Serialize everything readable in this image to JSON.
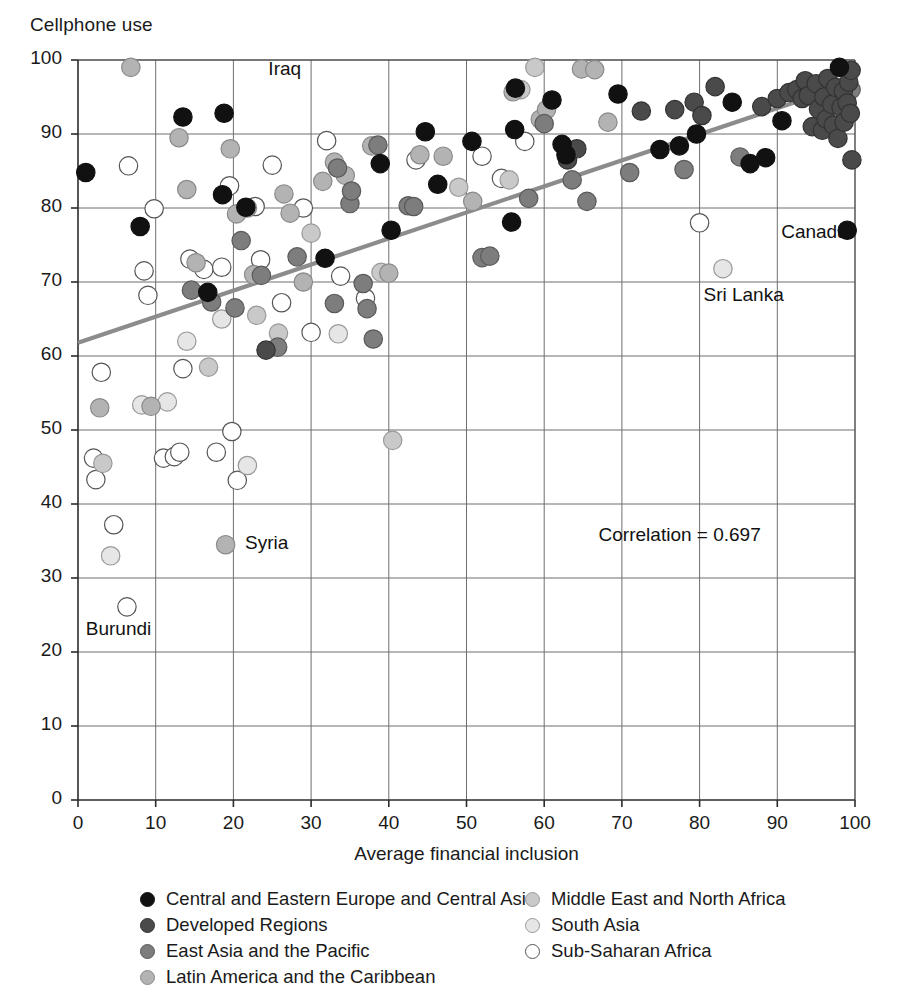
{
  "chart_data": {
    "type": "scatter",
    "title": "",
    "ylabel": "Cellphone use",
    "xlabel": "Average financial inclusion",
    "xlim": [
      0,
      100
    ],
    "ylim": [
      0,
      100
    ],
    "xticks": [
      0,
      10,
      20,
      30,
      40,
      50,
      60,
      70,
      80,
      90,
      100
    ],
    "yticks": [
      0,
      10,
      20,
      30,
      40,
      50,
      60,
      70,
      80,
      90,
      100
    ],
    "grid": true,
    "grid_step_x": 10,
    "grid_step_y": 10,
    "legend_position": "bottom",
    "trendline": {
      "x": [
        0,
        100
      ],
      "y": [
        61.8,
        97.0
      ],
      "color": "#8c8c8c"
    },
    "annotations": [
      {
        "text": "Iraq",
        "x": 24.5,
        "y": 98.5
      },
      {
        "text": "Canada",
        "x": 90.5,
        "y": 76.5
      },
      {
        "text": "Sri Lanka",
        "x": 80.5,
        "y": 68.0
      },
      {
        "text": "Syria",
        "x": 21.5,
        "y": 34.5
      },
      {
        "text": "Burundi",
        "x": 1.0,
        "y": 22.8
      },
      {
        "text": "Correlation = 0.697",
        "x": 67.0,
        "y": 35.5
      }
    ],
    "series": [
      {
        "name": "Central and Eastern Europe and Central Asia",
        "color": "#111111",
        "edge": "#111111",
        "points": [
          [
            1.0,
            84.8
          ],
          [
            8.0,
            77.5
          ],
          [
            13.5,
            92.3
          ],
          [
            18.8,
            92.8
          ],
          [
            18.6,
            81.8
          ],
          [
            16.7,
            68.6
          ],
          [
            21.6,
            80.1
          ],
          [
            31.8,
            73.2
          ],
          [
            38.9,
            86.0
          ],
          [
            40.3,
            77.0
          ],
          [
            44.7,
            90.3
          ],
          [
            46.3,
            83.2
          ],
          [
            50.7,
            89.0
          ],
          [
            55.8,
            78.1
          ],
          [
            56.2,
            90.6
          ],
          [
            56.3,
            96.2
          ],
          [
            61.0,
            94.6
          ],
          [
            62.3,
            88.6
          ],
          [
            62.8,
            87.2
          ],
          [
            69.5,
            95.4
          ],
          [
            74.9,
            87.9
          ],
          [
            77.4,
            88.4
          ],
          [
            79.6,
            90.0
          ],
          [
            84.2,
            94.3
          ],
          [
            86.5,
            86.0
          ],
          [
            88.5,
            86.8
          ],
          [
            90.6,
            91.8
          ],
          [
            98.0,
            99.0
          ],
          [
            99.0,
            77.0
          ]
        ]
      },
      {
        "name": "Developed Regions",
        "color": "#4a4a4a",
        "edge": "#333333",
        "points": [
          [
            24.2,
            60.8
          ],
          [
            63.0,
            86.5
          ],
          [
            64.2,
            88.0
          ],
          [
            72.5,
            93.1
          ],
          [
            76.8,
            93.3
          ],
          [
            79.3,
            94.3
          ],
          [
            80.3,
            92.5
          ],
          [
            82.0,
            96.4
          ],
          [
            88.0,
            93.7
          ],
          [
            90.0,
            94.8
          ],
          [
            91.5,
            95.6
          ],
          [
            92.5,
            96.0
          ],
          [
            93.2,
            94.8
          ],
          [
            93.6,
            97.2
          ],
          [
            94.0,
            95.2
          ],
          [
            94.5,
            91.0
          ],
          [
            95.0,
            96.8
          ],
          [
            95.3,
            93.4
          ],
          [
            95.8,
            90.5
          ],
          [
            96.0,
            95.0
          ],
          [
            96.3,
            92.0
          ],
          [
            96.5,
            97.5
          ],
          [
            97.0,
            94.0
          ],
          [
            97.2,
            91.2
          ],
          [
            97.5,
            96.3
          ],
          [
            97.8,
            89.4
          ],
          [
            98.2,
            93.6
          ],
          [
            98.5,
            95.8
          ],
          [
            98.6,
            91.6
          ],
          [
            99.0,
            94.2
          ],
          [
            99.2,
            97.0
          ],
          [
            99.4,
            92.8
          ],
          [
            99.5,
            98.6
          ],
          [
            99.6,
            86.5
          ]
        ]
      },
      {
        "name": "East Asia and the Pacific",
        "color": "#7d7d7d",
        "edge": "#5a5a5a",
        "points": [
          [
            14.6,
            68.9
          ],
          [
            17.2,
            67.3
          ],
          [
            20.2,
            66.5
          ],
          [
            21.0,
            75.6
          ],
          [
            23.6,
            70.9
          ],
          [
            25.7,
            61.2
          ],
          [
            28.2,
            73.4
          ],
          [
            33.0,
            67.1
          ],
          [
            33.4,
            85.4
          ],
          [
            35.0,
            80.6
          ],
          [
            35.2,
            82.3
          ],
          [
            36.7,
            69.8
          ],
          [
            37.2,
            66.4
          ],
          [
            38.0,
            62.3
          ],
          [
            38.6,
            88.5
          ],
          [
            42.5,
            80.3
          ],
          [
            43.2,
            80.2
          ],
          [
            52.0,
            73.3
          ],
          [
            53.0,
            73.5
          ],
          [
            58.0,
            81.3
          ],
          [
            60.0,
            91.4
          ],
          [
            63.6,
            83.8
          ],
          [
            65.5,
            80.9
          ],
          [
            71.0,
            84.8
          ],
          [
            78.0,
            85.2
          ],
          [
            85.2,
            86.9
          ],
          [
            99.5,
            96.0
          ]
        ]
      },
      {
        "name": "Latin America and the Caribbean",
        "color": "#b3b3b3",
        "edge": "#8a8a8a",
        "points": [
          [
            2.8,
            53.0
          ],
          [
            6.8,
            99.0
          ],
          [
            9.4,
            53.2
          ],
          [
            13.0,
            89.5
          ],
          [
            14.0,
            82.5
          ],
          [
            15.2,
            72.6
          ],
          [
            19.6,
            88.0
          ],
          [
            19.0,
            34.5
          ],
          [
            20.4,
            79.2
          ],
          [
            21.8,
            80.0
          ],
          [
            22.6,
            71.0
          ],
          [
            26.5,
            81.9
          ],
          [
            27.3,
            79.3
          ],
          [
            29.0,
            70.0
          ],
          [
            31.5,
            83.6
          ],
          [
            33.0,
            86.2
          ],
          [
            34.4,
            84.4
          ],
          [
            37.8,
            88.4
          ],
          [
            40.0,
            71.2
          ],
          [
            44.0,
            87.2
          ],
          [
            47.0,
            87.0
          ],
          [
            50.8,
            80.9
          ],
          [
            56.0,
            95.7
          ],
          [
            59.5,
            92.0
          ],
          [
            60.3,
            93.3
          ],
          [
            64.8,
            98.8
          ],
          [
            66.5,
            98.7
          ],
          [
            68.2,
            91.6
          ]
        ]
      },
      {
        "name": "Middle East and North Africa",
        "color": "#c9c9c9",
        "edge": "#9a9a9a",
        "points": [
          [
            3.2,
            45.5
          ],
          [
            16.8,
            58.5
          ],
          [
            23.0,
            65.5
          ],
          [
            25.8,
            63.1
          ],
          [
            30.0,
            76.6
          ],
          [
            39.0,
            71.3
          ],
          [
            40.5,
            48.6
          ],
          [
            49.0,
            82.8
          ],
          [
            55.5,
            83.8
          ],
          [
            57.0,
            96.0
          ],
          [
            58.8,
            99.0
          ],
          [
            96.0,
            95.8
          ]
        ]
      },
      {
        "name": "South Asia",
        "color": "#e6e6e6",
        "edge": "#999999",
        "points": [
          [
            4.2,
            33.0
          ],
          [
            8.2,
            53.4
          ],
          [
            11.5,
            53.8
          ],
          [
            14.0,
            62.0
          ],
          [
            18.5,
            65.0
          ],
          [
            21.8,
            45.2
          ],
          [
            33.5,
            63.0
          ],
          [
            83.0,
            71.8
          ]
        ]
      },
      {
        "name": "Sub-Saharan Africa",
        "color": "#ffffff",
        "edge": "#555555",
        "points": [
          [
            2.0,
            46.2
          ],
          [
            2.3,
            43.3
          ],
          [
            4.6,
            37.2
          ],
          [
            6.3,
            26.1
          ],
          [
            3.0,
            57.8
          ],
          [
            6.5,
            85.7
          ],
          [
            8.5,
            71.5
          ],
          [
            9.0,
            68.2
          ],
          [
            9.8,
            79.9
          ],
          [
            11.0,
            46.2
          ],
          [
            12.4,
            46.4
          ],
          [
            13.1,
            47.0
          ],
          [
            13.5,
            58.3
          ],
          [
            14.4,
            73.1
          ],
          [
            16.2,
            71.7
          ],
          [
            17.8,
            47.0
          ],
          [
            18.5,
            72.0
          ],
          [
            19.5,
            83.0
          ],
          [
            19.8,
            49.8
          ],
          [
            20.5,
            43.2
          ],
          [
            22.8,
            80.2
          ],
          [
            23.5,
            73.0
          ],
          [
            25.0,
            85.8
          ],
          [
            26.2,
            67.2
          ],
          [
            29.0,
            80.0
          ],
          [
            30.0,
            63.2
          ],
          [
            32.0,
            89.1
          ],
          [
            33.8,
            70.8
          ],
          [
            37.0,
            67.8
          ],
          [
            43.5,
            86.5
          ],
          [
            52.0,
            87.0
          ],
          [
            54.5,
            84.0
          ],
          [
            57.5,
            89.0
          ],
          [
            80.0,
            78.0
          ]
        ]
      }
    ]
  },
  "legend": {
    "left_items": [
      "Central and Eastern Europe and Central Asia",
      "Developed Regions",
      "East Asia and the Pacific",
      "Latin America and the Caribbean"
    ],
    "right_items": [
      "Middle East and North Africa",
      "South Asia",
      "Sub-Saharan Africa"
    ]
  }
}
